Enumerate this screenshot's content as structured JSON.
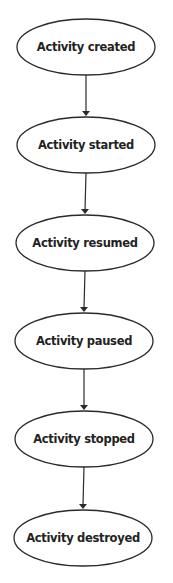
{
  "diagram": {
    "type": "flowchart",
    "direction": "top-to-bottom",
    "colors": {
      "stroke": "#2a2a2a",
      "text": "#222222",
      "fill": "#ffffff",
      "background": "#ffffff"
    },
    "nodes": [
      {
        "id": "created",
        "label": "Activity created",
        "cx": 86,
        "cy": 47,
        "rx": 69,
        "ry": 28
      },
      {
        "id": "started",
        "label": "Activity started",
        "cx": 86,
        "cy": 145,
        "rx": 69,
        "ry": 28
      },
      {
        "id": "resumed",
        "label": "Activity resumed",
        "cx": 85,
        "cy": 243,
        "rx": 69,
        "ry": 28
      },
      {
        "id": "paused",
        "label": "Activity paused",
        "cx": 84,
        "cy": 341,
        "rx": 69,
        "ry": 28
      },
      {
        "id": "stopped",
        "label": "Activity stopped",
        "cx": 84,
        "cy": 439,
        "rx": 69,
        "ry": 28
      },
      {
        "id": "destroyed",
        "label": "Activity destroyed",
        "cx": 83,
        "cy": 538,
        "rx": 69,
        "ry": 28
      }
    ],
    "edges": [
      {
        "from": "created",
        "to": "started"
      },
      {
        "from": "started",
        "to": "resumed"
      },
      {
        "from": "resumed",
        "to": "paused"
      },
      {
        "from": "paused",
        "to": "stopped"
      },
      {
        "from": "stopped",
        "to": "destroyed"
      }
    ]
  }
}
